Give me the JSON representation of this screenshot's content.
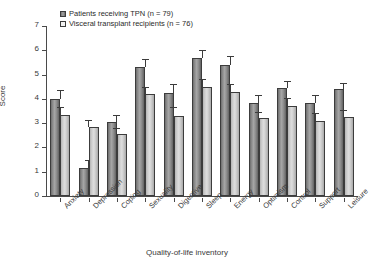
{
  "chart_data": {
    "type": "bar",
    "title": "",
    "xlabel": "Quality-of-life inventory",
    "ylabel": "Score",
    "ylim": [
      0,
      7
    ],
    "yticks": [
      0,
      1,
      2,
      3,
      4,
      5,
      6,
      7
    ],
    "grid": false,
    "legend_position": "top-left",
    "categories": [
      "Anxiety",
      "Depression",
      "Coping",
      "Sexuality",
      "Digestive",
      "Sleep",
      "Energy",
      "Optimism",
      "Control",
      "Support",
      "Leisure"
    ],
    "series": [
      {
        "name": "Patients receiving TPN (n = 79)",
        "color": "#8d8d8d",
        "values": [
          4.0,
          1.15,
          3.05,
          5.3,
          4.25,
          5.7,
          5.4,
          3.85,
          4.45,
          3.85,
          4.4
        ],
        "errors": [
          0.35,
          0.35,
          0.3,
          0.35,
          0.35,
          0.3,
          0.35,
          0.3,
          0.3,
          0.3,
          0.25
        ]
      },
      {
        "name": "Visceral transplant recipients (n = 76)",
        "color": "#dedede",
        "values": [
          3.35,
          2.85,
          2.55,
          4.2,
          3.3,
          4.5,
          4.3,
          3.2,
          3.7,
          3.1,
          3.25
        ],
        "errors": [
          0.3,
          0.3,
          0.25,
          0.3,
          0.35,
          0.3,
          0.3,
          0.25,
          0.35,
          0.3,
          0.3
        ]
      }
    ]
  },
  "legend": {
    "items": [
      {
        "label": "Patients receiving TPN (n = 79)"
      },
      {
        "label": "Visceral transplant recipients (n = 76)"
      }
    ]
  }
}
